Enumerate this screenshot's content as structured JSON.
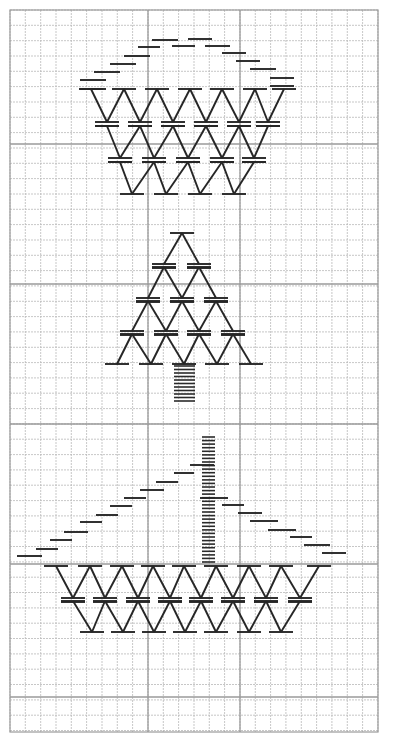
{
  "diagram": {
    "background": "#ffffff",
    "ink_color": "#262626",
    "grid": {
      "left": 10,
      "top": 10,
      "right": 378,
      "bottom": 732,
      "cell": 15.33,
      "bold_rows_y": [
        144,
        284,
        424,
        564,
        697
      ],
      "bold_cols_x": [
        148,
        240
      ]
    },
    "motifs": [
      {
        "name": "basket",
        "arc_dashes": [
          [
            80,
            80,
            106,
            80
          ],
          [
            80,
            89,
            106,
            89
          ],
          [
            94,
            72,
            120,
            72
          ],
          [
            110,
            64,
            136,
            64
          ],
          [
            124,
            56,
            150,
            56
          ],
          [
            138,
            47,
            160,
            47
          ],
          [
            152,
            40,
            178,
            40
          ],
          [
            172,
            46,
            195,
            46
          ],
          [
            188,
            39,
            212,
            39
          ],
          [
            205,
            46,
            230,
            46
          ],
          [
            222,
            53,
            246,
            53
          ],
          [
            236,
            61,
            260,
            61
          ],
          [
            250,
            69,
            276,
            69
          ],
          [
            270,
            78,
            294,
            78
          ],
          [
            270,
            86,
            294,
            86
          ]
        ],
        "zigzag_rows": [
          {
            "top_y": 89,
            "bottom_y": 122,
            "peaks_x": [
              91,
              124,
              157,
              190,
              222,
              255,
              284
            ],
            "valleys_x": [
              107,
              140,
              173,
              206,
              239,
              268
            ],
            "double_bottom": true
          },
          {
            "top_y": 126,
            "bottom_y": 158,
            "peaks_x": [
              107,
              140,
              173,
              206,
              239,
              268
            ],
            "valleys_x": [
              120,
              154,
              188,
              222,
              254
            ],
            "double_bottom": true
          },
          {
            "top_y": 162,
            "bottom_y": 194,
            "peaks_x": [
              120,
              154,
              188,
              222,
              254
            ],
            "valleys_x": [
              132,
              166,
              200,
              234
            ],
            "double_bottom": false
          }
        ]
      },
      {
        "name": "tree",
        "zigzag_rows": [
          {
            "top_y": 233,
            "bottom_y": 264,
            "peaks_x": [
              182
            ],
            "valleys_x": [
              164,
              199
            ],
            "double_bottom": true
          },
          {
            "top_y": 267,
            "bottom_y": 298,
            "peaks_x": [
              164,
              199
            ],
            "valleys_x": [
              148,
              182,
              216
            ],
            "double_bottom": true
          },
          {
            "top_y": 301,
            "bottom_y": 331,
            "peaks_x": [
              148,
              182,
              216
            ],
            "valleys_x": [
              132,
              166,
              199,
              233
            ],
            "double_bottom": true
          },
          {
            "top_y": 334,
            "bottom_y": 364,
            "peaks_x": [
              132,
              166,
              199,
              233
            ],
            "valleys_x": [
              117,
              151,
              184,
              217,
              251
            ],
            "double_bottom": false
          }
        ],
        "trunk": {
          "x1": 174,
          "x2": 195,
          "y_start": 366,
          "y_end": 401,
          "lines": 11
        }
      },
      {
        "name": "sailboat",
        "mast": {
          "x1": 202,
          "x2": 215,
          "y_start": 437,
          "y_end": 562,
          "lines": 36
        },
        "sail_left_dashes": [
          [
            17,
            556,
            42,
            556
          ],
          [
            36,
            549,
            58,
            549
          ],
          [
            50,
            540,
            72,
            540
          ],
          [
            64,
            532,
            88,
            532
          ],
          [
            80,
            522,
            102,
            522
          ],
          [
            96,
            515,
            118,
            515
          ],
          [
            110,
            506,
            132,
            506
          ],
          [
            124,
            498,
            146,
            498
          ],
          [
            140,
            490,
            164,
            490
          ],
          [
            156,
            482,
            178,
            482
          ],
          [
            174,
            473,
            194,
            473
          ],
          [
            190,
            465,
            214,
            465
          ]
        ],
        "sail_right_dashes": [
          [
            200,
            498,
            228,
            498
          ],
          [
            222,
            505,
            244,
            505
          ],
          [
            238,
            513,
            262,
            513
          ],
          [
            250,
            521,
            278,
            521
          ],
          [
            268,
            530,
            296,
            530
          ],
          [
            290,
            537,
            312,
            537
          ],
          [
            304,
            545,
            330,
            545
          ],
          [
            322,
            553,
            346,
            553
          ]
        ],
        "zigzag_rows": [
          {
            "top_y": 566,
            "bottom_y": 598,
            "peaks_x": [
              56,
              90,
              122,
              153,
              184,
              216,
              249,
              281,
              319
            ],
            "valleys_x": [
              73,
              105,
              138,
              170,
              201,
              233,
              266,
              300
            ],
            "double_bottom": true
          },
          {
            "top_y": 601,
            "bottom_y": 632,
            "peaks_x": [
              73,
              105,
              138,
              170,
              201,
              233,
              266,
              300
            ],
            "valleys_x": [
              92,
              123,
              154,
              185,
              216,
              249,
              281
            ],
            "double_bottom": false
          }
        ]
      }
    ]
  }
}
